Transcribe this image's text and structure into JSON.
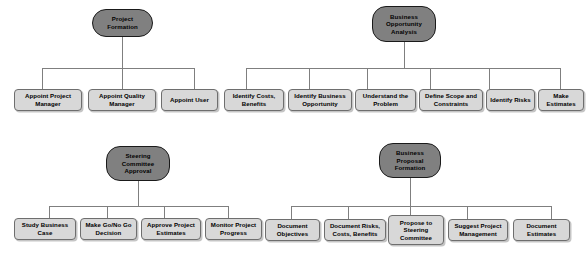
{
  "diagram": {
    "type": "org-chart-cluster-set",
    "colors": {
      "root_fill": "#808080",
      "root_border": "#1a1a1a",
      "leaf_fill": "#d8d8d8",
      "leaf_border": "#6e6e6e",
      "connector": "#7f7f7f",
      "text": "#000000",
      "background": "#ffffff"
    },
    "clusters": [
      {
        "id": "project-formation",
        "root": "Project Formation",
        "leaves": [
          "Appoint Project Manager",
          "Appoint Quality Manager",
          "Appoint User"
        ]
      },
      {
        "id": "business-opportunity-analysis",
        "root": "Business Opportunity Analysis",
        "leaves": [
          "Identify Costs, Benefits",
          "Identify Business Opportunity",
          "Understand the Problem",
          "Define Scope and Constraints",
          "Identify Risks",
          "Make Estimates"
        ]
      },
      {
        "id": "steering-committee-approval",
        "root": "Steering Committee Approval",
        "leaves": [
          "Study Business Case",
          "Make Go/No Go Decision",
          "Approve Project Estimates",
          "Monitor Project Progress"
        ]
      },
      {
        "id": "business-proposal-formation",
        "root": "Business Proposal Formation",
        "leaves": [
          "Document Objectives",
          "Document Risks, Costs,  Benefits",
          "Propose to Steering Committee",
          "Suggest Project Management",
          "Document Estimates"
        ]
      }
    ]
  }
}
